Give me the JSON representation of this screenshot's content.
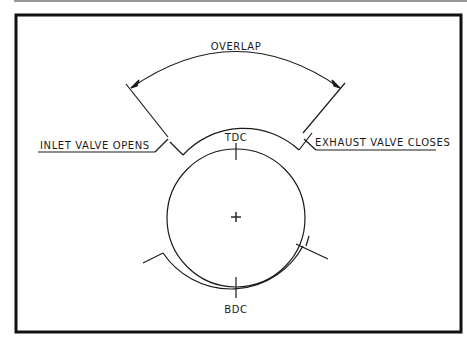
{
  "diagram": {
    "title_arc_label": "OVERLAP",
    "top_marker": "TDC",
    "bottom_marker": "BDC",
    "left_label": "INLET VALVE OPENS",
    "right_label": "EXHAUST VALVE CLOSES",
    "center_symbol": "+"
  }
}
